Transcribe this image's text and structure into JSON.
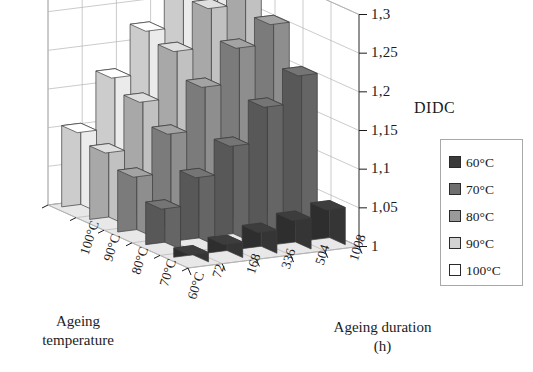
{
  "figure": {
    "value_axis_title": "DIDC",
    "depth_axis_title_line1": "Ageing",
    "depth_axis_title_line2": "temperature",
    "horizontal_axis_title_line1": "Ageing duration",
    "horizontal_axis_title_line2": "(h)"
  },
  "legend": {
    "items": [
      {
        "label": "60°C",
        "color": "#3a3a3a"
      },
      {
        "label": "70°C",
        "color": "#6e6e6e"
      },
      {
        "label": "80°C",
        "color": "#9a9a9a"
      },
      {
        "label": "90°C",
        "color": "#d2d2d2"
      },
      {
        "label": "100°C",
        "color": "#ffffff"
      }
    ]
  },
  "chart_data": {
    "type": "bar",
    "title": "",
    "subtitle": "",
    "xlabel": "Ageing duration (h)",
    "ylabel": "DIDC",
    "zlabel": "Ageing temperature",
    "projection": "3d-grouped-bar",
    "grid": true,
    "legend_position": "right",
    "categories": [
      "72",
      "168",
      "336",
      "504",
      "1008"
    ],
    "depth_categories": [
      "100°C",
      "90°C",
      "80°C",
      "70°C",
      "60°C"
    ],
    "ylim": [
      1,
      1.3
    ],
    "yticks": [
      1,
      1.05,
      1.1,
      1.15,
      1.2,
      1.25,
      1.3
    ],
    "ytick_labels": [
      "1",
      "1,05",
      "1,1",
      "1,15",
      "1,2",
      "1,25",
      "1,3"
    ],
    "decimal_separator": ",",
    "series": [
      {
        "name": "60°C",
        "color": "#3a3a3a",
        "values": [
          1.012,
          1.02,
          1.03,
          1.04,
          1.048
        ]
      },
      {
        "name": "70°C",
        "color": "#6e6e6e",
        "values": [
          1.055,
          1.09,
          1.125,
          1.17,
          1.205
        ]
      },
      {
        "name": "80°C",
        "color": "#9a9a9a",
        "values": [
          1.08,
          1.13,
          1.185,
          1.23,
          1.255
        ]
      },
      {
        "name": "90°C",
        "color": "#d2d2d2",
        "values": [
          1.095,
          1.155,
          1.215,
          1.265,
          1.3
        ]
      },
      {
        "name": "100°C",
        "color": "#ffffff",
        "values": [
          1.105,
          1.17,
          1.225,
          1.27,
          1.305
        ]
      }
    ]
  }
}
